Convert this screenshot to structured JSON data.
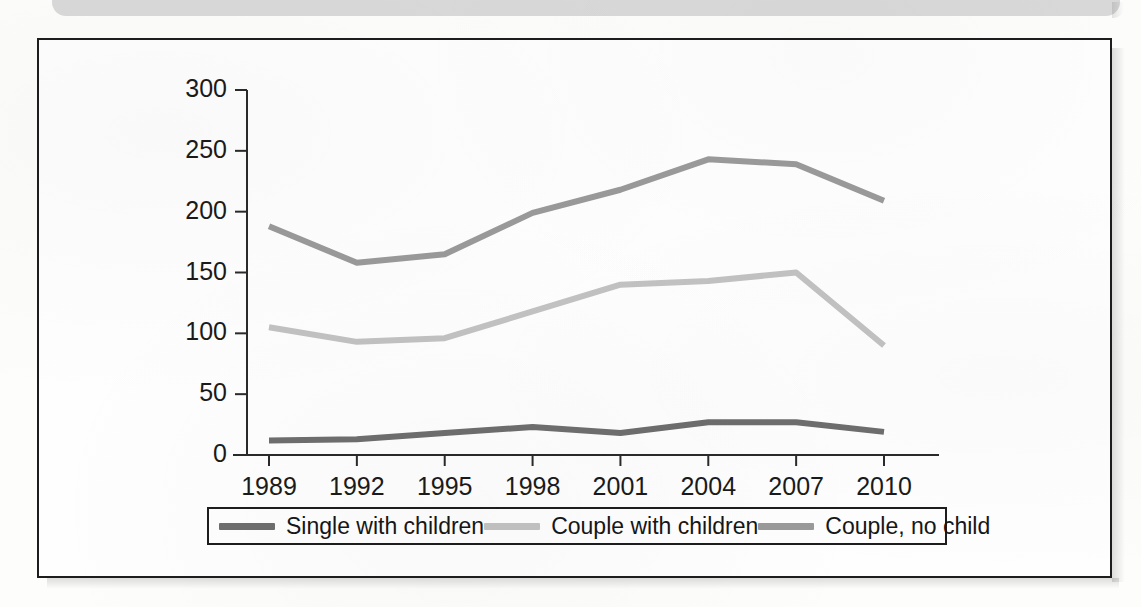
{
  "page": {
    "banner_label": "top-banner-strip"
  },
  "chart_data": {
    "type": "line",
    "title": "",
    "subtitle": "",
    "xlabel": "",
    "ylabel": "",
    "categories": [
      "1989",
      "1992",
      "1995",
      "1998",
      "2001",
      "2004",
      "2007",
      "2010"
    ],
    "x_tick_labels": [
      "1989",
      "1992",
      "1995",
      "1998",
      "2001",
      "2004",
      "2007",
      "2010"
    ],
    "y_tick_labels": [
      "0",
      "50",
      "100",
      "150",
      "200",
      "250",
      "300"
    ],
    "y_ticks": [
      0,
      50,
      100,
      150,
      200,
      250,
      300
    ],
    "ylim": [
      0,
      300
    ],
    "grid": false,
    "legend_position": "bottom",
    "series": [
      {
        "name": "Single with children",
        "color": "#6e6e6e",
        "values": [
          12,
          13,
          18,
          23,
          18,
          27,
          27,
          19
        ]
      },
      {
        "name": "Couple with children",
        "color": "#c2c2c2",
        "values": [
          105,
          93,
          96,
          118,
          140,
          143,
          150,
          90
        ]
      },
      {
        "name": "Couple, no child",
        "color": "#9a9a9a",
        "values": [
          188,
          158,
          165,
          199,
          218,
          243,
          239,
          209
        ]
      }
    ]
  },
  "legend": {
    "items": [
      {
        "label": "Single with children",
        "color": "#6e6e6e"
      },
      {
        "label": "Couple with children",
        "color": "#c2c2c2"
      },
      {
        "label": "Couple, no child",
        "color": "#9a9a9a"
      }
    ]
  },
  "colors": {
    "frame": "#1d1d1d",
    "banner": "#d9d9d9",
    "background": "#fdfdfc",
    "axis": "#2a2a2a"
  }
}
